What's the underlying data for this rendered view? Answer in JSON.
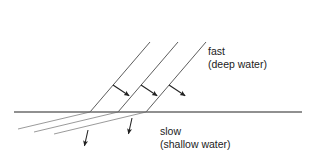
{
  "diagram": {
    "background_color": "#ffffff",
    "boundary": {
      "name": "water-depth-boundary",
      "color": "#6b6b6b",
      "x1": 14,
      "y1": 112,
      "x2": 302,
      "y2": 112,
      "width": 1.6
    },
    "incident_wavefronts": {
      "name": "fast-deep-water-wavefronts",
      "color": "#4a4a4a",
      "width": 0.9,
      "lines": [
        {
          "x1": 150,
          "y1": 42,
          "x2": 90,
          "y2": 112
        },
        {
          "x1": 178,
          "y1": 42,
          "x2": 118,
          "y2": 112
        },
        {
          "x1": 206,
          "y1": 42,
          "x2": 146,
          "y2": 112
        }
      ]
    },
    "refracted_wavefronts": {
      "name": "slow-shallow-water-wavefronts",
      "color": "#8e8e8e",
      "width": 0.9,
      "lines": [
        {
          "x1": 90,
          "y1": 112,
          "x2": 18,
          "y2": 129
        },
        {
          "x1": 118,
          "y1": 112,
          "x2": 34,
          "y2": 132
        },
        {
          "x1": 146,
          "y1": 112,
          "x2": 54,
          "y2": 134
        }
      ]
    },
    "incident_rays": {
      "name": "incident-direction-arrows",
      "color": "#222222",
      "width": 1.1,
      "arrows": [
        {
          "x1": 113,
          "y1": 85,
          "x2": 131,
          "y2": 97
        },
        {
          "x1": 141,
          "y1": 85,
          "x2": 159,
          "y2": 97
        },
        {
          "x1": 169,
          "y1": 85,
          "x2": 187,
          "y2": 97
        }
      ]
    },
    "refracted_rays": {
      "name": "refracted-direction-arrows",
      "color": "#222222",
      "width": 1.1,
      "arrows": [
        {
          "x1": 132,
          "y1": 118,
          "x2": 128,
          "y2": 136
        },
        {
          "x1": 88,
          "y1": 130,
          "x2": 84,
          "y2": 148
        }
      ]
    },
    "labels": {
      "fast": {
        "name": "fast-label",
        "line1": "fast",
        "line2": "(deep water)",
        "x": 208,
        "y1": 55,
        "y2": 68
      },
      "slow": {
        "name": "slow-label",
        "line1": "slow",
        "line2": "(shallow water)",
        "x": 160,
        "y1": 135,
        "y2": 148
      }
    }
  }
}
